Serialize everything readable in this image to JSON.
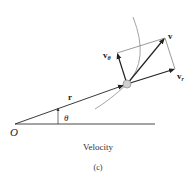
{
  "diagram": {
    "labels": {
      "origin": "O",
      "theta": "θ",
      "position_vector": "r",
      "velocity": "v",
      "velocity_theta_base": "v",
      "velocity_theta_sub": "θ",
      "velocity_radial_base": "v",
      "velocity_radial_sub": "r"
    },
    "caption": "Velocity",
    "subcaption": "(c)",
    "colors": {
      "vector": "#222222",
      "path_curve": "#9a9a9a",
      "particle": "#d0d0d0"
    }
  }
}
